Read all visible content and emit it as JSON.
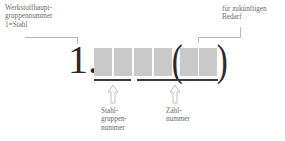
{
  "diagram": {
    "prefix_digit": "1.",
    "labels": {
      "main_group": "Werkstoffhaupt-\ngruppennummer\n1=Stahl",
      "future_use": "für zukünftigen\nBedarf",
      "steel_group": "Stahl-\ngruppen-\nnummer",
      "count_number": "Zähl-\nnummer"
    },
    "boxes": [
      {
        "id": 1,
        "group": "steel_group"
      },
      {
        "id": 2,
        "group": "steel_group"
      },
      {
        "id": 3,
        "group": "count_number"
      },
      {
        "id": 4,
        "group": "count_number"
      },
      {
        "id": 5,
        "group": "future_use"
      },
      {
        "id": 6,
        "group": "future_use"
      }
    ],
    "parentheses": {
      "open": "(",
      "close": ")"
    },
    "colors": {
      "box_fill": "#c9c9c9",
      "text": "#2a2a2a",
      "callout_line": "#b8b8b8"
    }
  }
}
